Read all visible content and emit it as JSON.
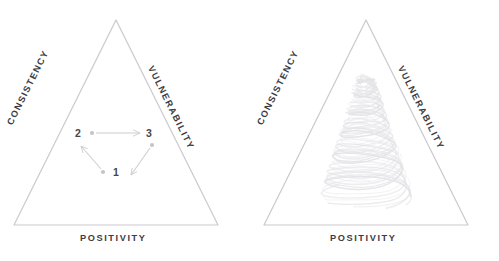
{
  "figure": {
    "type": "diagram",
    "background_color": "#ffffff",
    "triangle_stroke_color": "#c9c9cf",
    "label_color": "#3c3c42",
    "node_color": "#c4c4ca",
    "arrow_color": "#c9c9cf",
    "spiral_color": "#e2e2e6"
  },
  "panels": [
    {
      "id": "left",
      "name": "triangle-with-cycle",
      "triangle": {
        "apex": [
          116,
          20
        ],
        "bottom_left": [
          14,
          225
        ],
        "bottom_right": [
          218,
          225
        ]
      },
      "edges": {
        "left_label": "CONSISTENCY",
        "right_label": "VULNERABILITY",
        "base_label": "POSITIVITY"
      },
      "nodes": [
        {
          "label": "1",
          "x": 103,
          "y": 172,
          "label_x": 113,
          "label_y": 168
        },
        {
          "label": "2",
          "x": 92,
          "y": 133,
          "label_x": 75,
          "label_y": 128
        },
        {
          "label": "3",
          "x": 152,
          "y": 145,
          "label_x": 146,
          "label_y": 128
        }
      ],
      "arrows": [
        {
          "from": "2",
          "to": "3",
          "x1": 95,
          "y1": 133,
          "x2": 141,
          "y2": 133
        },
        {
          "from": "3",
          "to": "1",
          "x1": 150,
          "y1": 148,
          "x2": 130,
          "y2": 176
        },
        {
          "from": "1",
          "to": "2",
          "x1": 101,
          "y1": 169,
          "x2": 80,
          "y2": 146
        }
      ]
    },
    {
      "id": "right",
      "name": "triangle-with-spiral",
      "triangle": {
        "apex": [
          116,
          20
        ],
        "bottom_left": [
          14,
          225
        ],
        "bottom_right": [
          218,
          225
        ]
      },
      "edges": {
        "left_label": "CONSISTENCY",
        "right_label": "VULNERABILITY",
        "base_label": "POSITIVITY"
      },
      "spiral": {
        "description": "conical-helix-scribble",
        "center_x": 116,
        "top_y": 78,
        "bottom_y": 196,
        "turns": 6,
        "top_radius": 7,
        "bottom_radius": 45
      }
    }
  ]
}
